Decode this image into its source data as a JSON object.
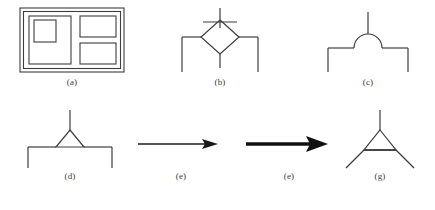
{
  "figure": {
    "background_color": "#ffffff",
    "stroke_color": "#3d3d3d",
    "bold_stroke_color": "#1a1a1a",
    "label_color": "#3a3a3a",
    "panels": [
      {
        "id": "a",
        "label": "(a)",
        "icon_name": "nested-rectangles-layout-glyph",
        "description": "Double-bordered outer rectangle containing a large square with a smaller square inset at its top-left, plus two stacked rectangles on the right",
        "x": 18,
        "y": 6,
        "width": 108,
        "height": 68,
        "label_y": 78,
        "shapes": [
          {
            "type": "rect",
            "name": "outer-frame-outer",
            "x": 2,
            "y": 2,
            "w": 104,
            "h": 64
          },
          {
            "type": "rect",
            "name": "outer-frame-inner",
            "x": 5,
            "y": 5,
            "w": 98,
            "h": 58
          },
          {
            "type": "rect",
            "name": "left-large-panel",
            "x": 11,
            "y": 10,
            "w": 42,
            "h": 48
          },
          {
            "type": "rect",
            "name": "left-inset-square",
            "x": 16,
            "y": 14,
            "w": 22,
            "h": 22
          },
          {
            "type": "rect",
            "name": "right-top-panel",
            "x": 62,
            "y": 10,
            "w": 36,
            "h": 21
          },
          {
            "type": "rect",
            "name": "right-bottom-panel",
            "x": 62,
            "y": 37,
            "w": 36,
            "h": 21
          }
        ]
      },
      {
        "id": "b",
        "label": "(b)",
        "icon_name": "diamond-junction-glyph",
        "description": "Diamond node with vertical stem above crossed by a horizontal tick, vertical stub below, and two horizontal arms ending in downward legs",
        "x": 175,
        "y": 6,
        "width": 90,
        "height": 68,
        "label_y": 78
      },
      {
        "id": "c",
        "label": "(c)",
        "icon_name": "semicircle-junction-glyph",
        "description": "Semicircular arc resting on a horizontal bar with a vertical stem rising from the arc apex and downward legs at both bar ends",
        "x": 320,
        "y": 6,
        "width": 96,
        "height": 68,
        "label_y": 78
      },
      {
        "id": "d",
        "label": "(d)",
        "icon_name": "triangle-junction-glyph",
        "description": "Small triangle resting on a horizontal bar with a vertical stem rising from the apex and downward legs at both bar ends",
        "x": 22,
        "y": 108,
        "width": 96,
        "height": 62,
        "label_y": 172
      },
      {
        "id": "e1",
        "label": "(e)",
        "icon_name": "thin-right-arrow",
        "description": "Thin horizontal arrow pointing right",
        "x": 136,
        "y": 108,
        "width": 90,
        "height": 62,
        "label_y": 172
      },
      {
        "id": "e2",
        "label": "(e)",
        "icon_name": "bold-right-arrow",
        "description": "Bold horizontal arrow pointing right",
        "x": 244,
        "y": 108,
        "width": 90,
        "height": 62,
        "label_y": 172
      },
      {
        "id": "g",
        "label": "(g)",
        "icon_name": "triangle-with-splayed-legs-glyph",
        "description": "Triangle with a vertical stem above the apex and two diagonal legs splaying downward from the base corners",
        "x": 340,
        "y": 108,
        "width": 80,
        "height": 62,
        "label_y": 172
      }
    ]
  }
}
